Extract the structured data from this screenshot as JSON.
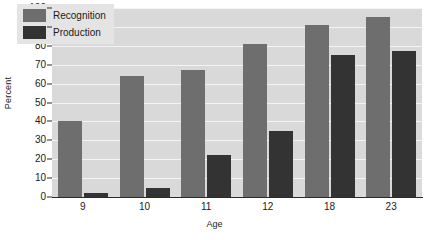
{
  "chart_data": {
    "type": "bar",
    "title": "",
    "xlabel": "Age",
    "ylabel": "Percent",
    "categories": [
      "9",
      "10",
      "11",
      "12",
      "18",
      "23"
    ],
    "series": [
      {
        "name": "Recognition",
        "color": "#6e6e6e",
        "values": [
          40,
          64,
          67,
          81,
          91,
          95
        ]
      },
      {
        "name": "Production",
        "color": "#333333",
        "values": [
          2,
          5,
          22,
          35,
          75,
          77
        ]
      }
    ],
    "ylim": [
      0,
      100
    ],
    "yticks": [
      0,
      10,
      20,
      30,
      40,
      50,
      60,
      70,
      80,
      90,
      100
    ],
    "grid": true,
    "grid_axis": "y",
    "legend_position": "top-left",
    "plot_background": "#d9d9d9",
    "gridline_color": "#f4f4f4",
    "legend_background": "#e4e4e4"
  }
}
